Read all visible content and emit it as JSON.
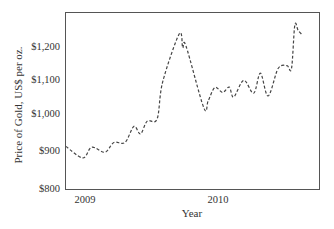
{
  "chart_data": {
    "type": "line",
    "title": "",
    "xlabel": "Year",
    "ylabel": "Price of Gold, US$ per oz.",
    "ylim": [
      800,
      1300
    ],
    "yticks": [
      800,
      900,
      1000,
      1100,
      1200
    ],
    "ytick_labels": [
      "$800",
      "$900",
      "$1,000",
      "$1,100",
      "$1,200"
    ],
    "xticks": [
      "2009",
      "2010"
    ],
    "grid": false,
    "legend": null,
    "line_style": "dashed",
    "series": [
      {
        "name": "Gold price",
        "x": [
          -1.7,
          -0.2,
          0.6,
          1.8,
          2.6,
          3.6,
          4.4,
          5.0,
          5.6,
          6.5,
          7.0,
          8.5,
          8.8,
          9.1,
          10.7,
          11.1,
          11.7,
          12.4,
          13.0,
          13.4,
          14.3,
          15.2,
          15.8,
          16.5,
          17.4,
          18.2,
          18.6,
          18.9,
          19.2,
          19.6
        ],
        "x_unit": "months since Jan 2009",
        "values": [
          919,
          887,
          917,
          903,
          930,
          930,
          975,
          954,
          990,
          996,
          1100,
          1234,
          1195,
          1200,
          1027,
          1047,
          1084,
          1070,
          1085,
          1057,
          1104,
          1068,
          1124,
          1060,
          1137,
          1145,
          1137,
          1258,
          1244,
          1230
        ]
      }
    ]
  },
  "labels": {
    "xlabel": "Year",
    "ylabel": "Price of Gold, US$ per oz.",
    "xtick_0": "2009",
    "xtick_1": "2010",
    "ytick_0": "$800",
    "ytick_1": "$900",
    "ytick_2": "$1,000",
    "ytick_3": "$1,100",
    "ytick_4": "$1,200"
  },
  "colors": {
    "line": "#444444",
    "axis": "#555555",
    "text": "#333333"
  }
}
